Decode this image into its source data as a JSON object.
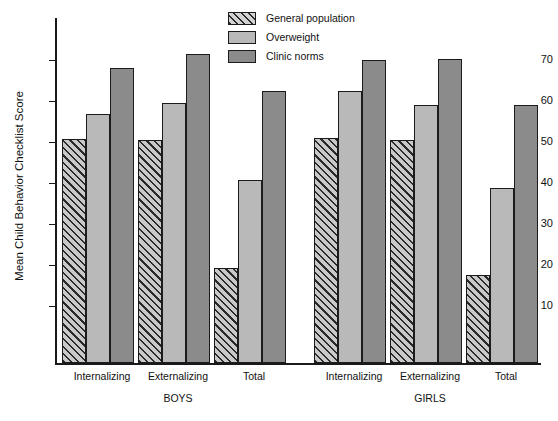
{
  "chart_data": {
    "type": "bar",
    "title": "",
    "xlabel": "",
    "ylabel": "Mean Child Behavior Checklist Score",
    "ylim": [
      0,
      78
    ],
    "yticks": [
      10,
      20,
      30,
      40,
      50,
      60,
      70
    ],
    "grid": false,
    "legend_position": "top-center",
    "categories": [
      "Internalizing",
      "Externalizing",
      "Total",
      "Internalizing",
      "Externalizing",
      "Total"
    ],
    "groups": [
      {
        "name": "BOYS",
        "categories": [
          "Internalizing",
          "Externalizing",
          "Total"
        ]
      },
      {
        "name": "GIRLS",
        "categories": [
          "Internalizing",
          "Externalizing",
          "Total"
        ]
      }
    ],
    "series": [
      {
        "name": "General population",
        "fill": "hatched",
        "color": "#b0b0b0",
        "values": [
          50.6,
          50.5,
          21.4,
          50.8,
          50.4,
          19.9
        ]
      },
      {
        "name": "Overweight",
        "fill": "solid",
        "color": "#b9b9b9",
        "values": [
          56.3,
          58.8,
          41.3,
          61.6,
          58.4,
          39.5
        ]
      },
      {
        "name": "Clinic norms",
        "fill": "solid",
        "color": "#8b8b8b",
        "values": [
          66.8,
          69.9,
          61.4,
          68.6,
          68.7,
          58.3
        ]
      }
    ]
  },
  "axis": {
    "y_title": "Mean Child Behavior Checklist Score",
    "tick_labels": [
      "70",
      "60",
      "50",
      "40",
      "30",
      "20",
      "10"
    ]
  },
  "legend": {
    "items": [
      {
        "label": "General population",
        "icon": "hatched-swatch"
      },
      {
        "label": "Overweight",
        "icon": "light-gray-swatch"
      },
      {
        "label": "Clinic norms",
        "icon": "dark-gray-swatch"
      }
    ]
  },
  "x_axis": {
    "category_labels": [
      "Internalizing",
      "Externalizing",
      "Total",
      "Internalizing",
      "Externalizing",
      "Total"
    ],
    "group_labels": [
      "BOYS",
      "GIRLS"
    ]
  }
}
